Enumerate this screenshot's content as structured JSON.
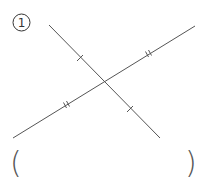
{
  "problem": {
    "number_label": "①",
    "number": "1"
  },
  "figure": {
    "line_a": {
      "x1": 49,
      "y1": 25,
      "x2": 160,
      "y2": 138,
      "tick_type": "single"
    },
    "line_b": {
      "x1": 13,
      "y1": 138,
      "x2": 195,
      "y2": 26,
      "tick_type": "double"
    },
    "intersection": {
      "x": 104,
      "y": 83
    },
    "single_ticks": [
      {
        "x": 80,
        "y": 58
      },
      {
        "x": 130,
        "y": 109
      }
    ],
    "double_ticks": [
      {
        "x": 148,
        "y": 55
      },
      {
        "x": 66,
        "y": 106
      }
    ],
    "line_color": "#555555"
  },
  "answer": {
    "open_paren": "(",
    "close_paren": ")",
    "value": "",
    "placeholder": ""
  }
}
